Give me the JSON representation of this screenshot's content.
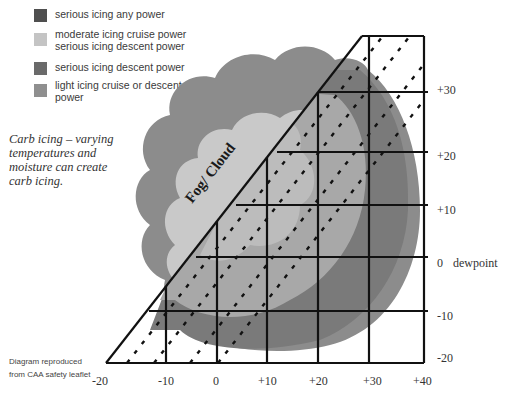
{
  "legend": {
    "items": [
      {
        "label_line1": "serious icing any power",
        "label_line2": "",
        "color": "#4f4f4f"
      },
      {
        "label_line1": "moderate icing cruise power",
        "label_line2": "serious icing descent power",
        "color": "#c4c4c4"
      },
      {
        "label_line1": "serious icing descent power",
        "label_line2": "",
        "color": "#6a6a6a"
      },
      {
        "label_line1": "light icing cruise or descent",
        "label_line2": "power",
        "color": "#8f8f8f"
      }
    ]
  },
  "caption": {
    "line1": "Carb icing – varying",
    "line2": "temperatures and",
    "line3": "moisture can create",
    "line4": "carb icing."
  },
  "credit": {
    "line1": "Diagram reproduced",
    "line2": "from CAA safety leaflet"
  },
  "cloud_label": "Fog/ Cloud",
  "x_axis": {
    "ticks": [
      "-20",
      "-10",
      "0",
      "+10",
      "+20",
      "+30",
      "+40"
    ]
  },
  "y_axis": {
    "ticks": [
      "+30",
      "+20",
      "+10",
      "0",
      "-10",
      "-20"
    ],
    "zero_suffix": "dewpoint"
  },
  "colors": {
    "outer_cloud": "#8c8c8c",
    "inner_cloud": "#c9c9c9",
    "mid_band": "#b0b0b0",
    "dark_band": "#7a7a7a",
    "grid_line": "#111111"
  }
}
